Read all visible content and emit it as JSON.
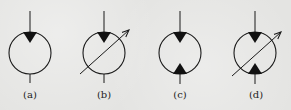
{
  "diagram": {
    "title": "",
    "background_color": "#e4e4e2",
    "stroke_color": "#1a1a1a",
    "symbols": [
      {
        "id": "a",
        "label": "(a)",
        "description": "fixed displacement, one direction",
        "center": [
          30,
          53
        ],
        "radius": 21,
        "top_triangle": true,
        "bottom_triangle": false,
        "variable_arrow": false
      },
      {
        "id": "b",
        "label": "(b)",
        "description": "variable displacement, one direction",
        "center": [
          104,
          53
        ],
        "radius": 21,
        "top_triangle": true,
        "bottom_triangle": false,
        "variable_arrow": true
      },
      {
        "id": "c",
        "label": "(c)",
        "description": "fixed displacement, two directions",
        "center": [
          180,
          53
        ],
        "radius": 21,
        "top_triangle": true,
        "bottom_triangle": true,
        "variable_arrow": false
      },
      {
        "id": "d",
        "label": "(d)",
        "description": "variable displacement, two directions",
        "center": [
          255,
          53
        ],
        "radius": 21,
        "top_triangle": true,
        "bottom_triangle": true,
        "variable_arrow": true
      }
    ]
  }
}
